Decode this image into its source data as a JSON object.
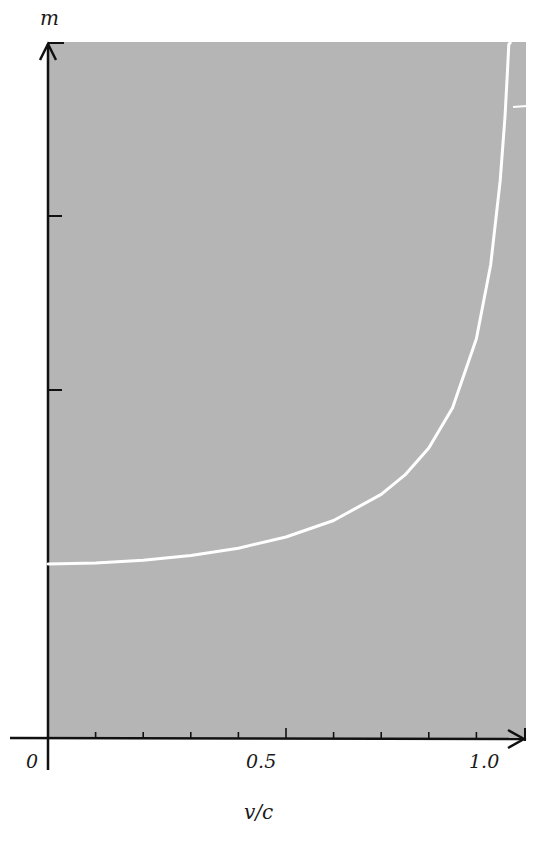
{
  "chart_data": {
    "type": "line",
    "title": "",
    "xlabel": "v/c",
    "ylabel": "m",
    "x_tick_labels": [
      "0",
      "0.5",
      "1.0"
    ],
    "x_ticks": [
      0,
      0.1,
      0.2,
      0.3,
      0.4,
      0.5,
      0.6,
      0.7,
      0.8,
      0.9,
      1.0
    ],
    "y_ticks_multiples_of_m0": [
      1,
      2,
      3,
      4
    ],
    "xlim": [
      0,
      1.0
    ],
    "ylim_multiples_of_m0": [
      0,
      4
    ],
    "grid": false,
    "legend": null,
    "background_color": "#b5b5b5",
    "curve_color": "#ffffff",
    "series": [
      {
        "name": "m = m0 / sqrt(1 - v^2/c^2)",
        "x": [
          0,
          0.1,
          0.2,
          0.3,
          0.4,
          0.5,
          0.6,
          0.7,
          0.75,
          0.8,
          0.85,
          0.9,
          0.93,
          0.95,
          0.96,
          0.965,
          0.968
        ],
        "y": [
          1.0,
          1.005,
          1.021,
          1.048,
          1.091,
          1.155,
          1.25,
          1.4,
          1.512,
          1.667,
          1.898,
          2.294,
          2.72,
          3.203,
          3.571,
          3.815,
          3.986
        ]
      }
    ]
  },
  "labels": {
    "y_axis": "m",
    "x_axis": "v/c",
    "origin": "0",
    "x_mid": "0.5",
    "x_end": "1.0"
  }
}
